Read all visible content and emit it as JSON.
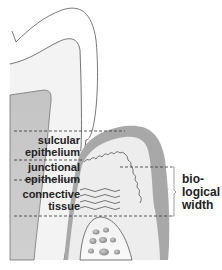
{
  "diagram": {
    "type": "anatomical illustration - tooth, gingiva and bone (biological width)",
    "labels": {
      "sulcular_epithelium": [
        "sulcular",
        "epithelium"
      ],
      "junctional_epithelium": [
        "junctional",
        "epithelium"
      ],
      "connective_tissue": [
        "connective",
        "tissue"
      ],
      "biological_width": [
        "bio-",
        "logical",
        "width"
      ]
    },
    "colors": {
      "enamel": "#ffffff",
      "dentin": "#f2f2f2",
      "pulp": "#c8c8c8",
      "gingiva_outer": "#a9a9a9",
      "gingiva_inner": "#ececec",
      "bone": "#f4f4f4",
      "bone_marrow": "#9a9a9a",
      "outline": "#555555",
      "dashed_line": "#333333",
      "text": "#222222"
    }
  }
}
